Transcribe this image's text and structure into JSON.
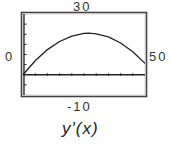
{
  "chart_data": {
    "type": "line",
    "title": "",
    "caption": "y'(x)",
    "xlabel": "",
    "ylabel": "",
    "window": {
      "xmin": 0,
      "xmax": 50,
      "ymin": -10,
      "ymax": 30,
      "xmin_label": "0",
      "xmax_label": "50",
      "ymin_label": "-10",
      "ymax_label": "30"
    },
    "xlim": [
      0,
      50
    ],
    "ylim": [
      -10,
      30
    ],
    "grid": false,
    "tick_spacing": {
      "x": 5,
      "y": 5
    },
    "series": [
      {
        "name": "y'(x)",
        "x": [
          0,
          5,
          10,
          15,
          20,
          25,
          27,
          30,
          35,
          40,
          45,
          50
        ],
        "values": [
          0,
          6.9,
          12.4,
          16.4,
          19.1,
          20.4,
          20.5,
          20.2,
          18.7,
          15.7,
          11.4,
          5.6
        ]
      }
    ]
  },
  "labels": {
    "ymax": "30",
    "ymin": "-10",
    "xmin": "0",
    "xmax": "50",
    "caption": "y'(x)"
  }
}
